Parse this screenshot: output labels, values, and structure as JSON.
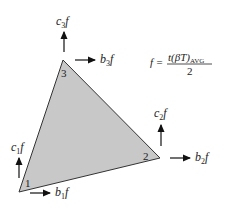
{
  "diagram": {
    "colors": {
      "fill": "#c8c8c8",
      "stroke": "#333333",
      "arrow": "#111111"
    },
    "nodes": [
      {
        "id": "1",
        "label": "1",
        "x": 19,
        "y": 192
      },
      {
        "id": "2",
        "label": "2",
        "x": 160,
        "y": 158
      },
      {
        "id": "3",
        "label": "3",
        "x": 63,
        "y": 60
      }
    ],
    "forces": [
      {
        "node": "1",
        "c_label": "c",
        "c_sub": "1",
        "b_label": "b",
        "b_sub": "1",
        "suffix": "f"
      },
      {
        "node": "2",
        "c_label": "c",
        "c_sub": "2",
        "b_label": "b",
        "b_sub": "2",
        "suffix": "f"
      },
      {
        "node": "3",
        "c_label": "c",
        "c_sub": "3",
        "b_label": "b",
        "b_sub": "3",
        "suffix": "f"
      }
    ],
    "equation": {
      "lhs": "f =",
      "numerator": "t(βT)",
      "numerator_sub": "AVG",
      "denominator": "2"
    }
  }
}
